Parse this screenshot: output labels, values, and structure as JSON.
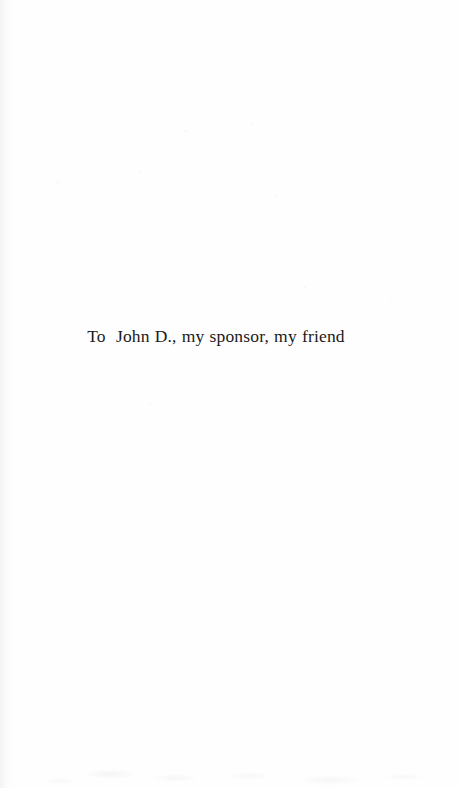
{
  "page": {
    "kind": "book-dedication-page",
    "background_color": "#fefefe",
    "ink_color": "#1a1a1a"
  },
  "dedication": {
    "text": "To  John D., my sponsor, my friend",
    "salutation": "To",
    "dedicatee": "John D.",
    "relationship": "my sponsor, my friend"
  }
}
